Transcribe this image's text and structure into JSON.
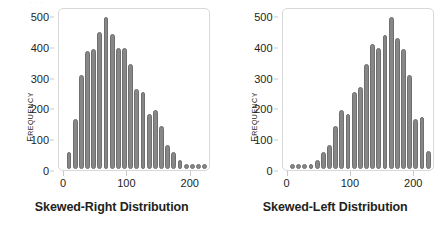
{
  "figure": {
    "background": "#ffffff",
    "bar_color": "#878787",
    "bar_edge_color": "#6f6f6f",
    "frame_color": "#d8d8d8",
    "text_color": "#231f20",
    "top_cropped_text": "· · ·"
  },
  "chart_data": [
    {
      "type": "bar",
      "title": "",
      "xlabel": "Skewed-Right Distribution",
      "ylabel": "Frequency",
      "xlim": [
        -8,
        232
      ],
      "ylim": [
        0,
        530
      ],
      "xticks": [
        0,
        100,
        200
      ],
      "yticks": [
        0,
        100,
        200,
        300,
        400,
        500
      ],
      "grid": false,
      "legend": false,
      "bin_width": 10,
      "categories": [
        5,
        15,
        25,
        35,
        45,
        55,
        65,
        75,
        85,
        95,
        105,
        115,
        125,
        135,
        145,
        155,
        165,
        175,
        185,
        195,
        205,
        215,
        225
      ],
      "values": [
        55,
        165,
        310,
        390,
        395,
        450,
        500,
        445,
        400,
        400,
        345,
        265,
        255,
        180,
        195,
        140,
        80,
        55,
        30,
        10,
        8,
        8,
        8
      ]
    },
    {
      "type": "bar",
      "title": "",
      "xlabel": "Skewed-Left Distribution",
      "ylabel": "Frequency",
      "xlim": [
        -8,
        232
      ],
      "ylim": [
        0,
        530
      ],
      "xticks": [
        0,
        100,
        200
      ],
      "yticks": [
        0,
        100,
        200,
        300,
        400,
        500
      ],
      "grid": false,
      "legend": false,
      "bin_width": 10,
      "categories": [
        5,
        15,
        25,
        35,
        45,
        55,
        65,
        75,
        85,
        95,
        105,
        115,
        125,
        135,
        145,
        155,
        165,
        175,
        185,
        195,
        205,
        215,
        225
      ],
      "values": [
        8,
        8,
        8,
        10,
        30,
        55,
        80,
        140,
        195,
        180,
        255,
        270,
        345,
        410,
        400,
        440,
        500,
        430,
        395,
        310,
        165,
        170,
        60
      ]
    }
  ],
  "panels": [
    {
      "name": "skewed-right",
      "xlabel": "Skewed-Right Distribution",
      "ylabel": "Frequency",
      "ytick_labels": [
        "500",
        "400",
        "300",
        "200",
        "100",
        "0"
      ],
      "xtick_labels": [
        "0",
        "100",
        "200"
      ]
    },
    {
      "name": "skewed-left",
      "xlabel": "Skewed-Left Distribution",
      "ylabel": "Frequency",
      "ytick_labels": [
        "500",
        "400",
        "300",
        "200",
        "100",
        "0"
      ],
      "xtick_labels": [
        "0",
        "100",
        "200"
      ]
    }
  ]
}
